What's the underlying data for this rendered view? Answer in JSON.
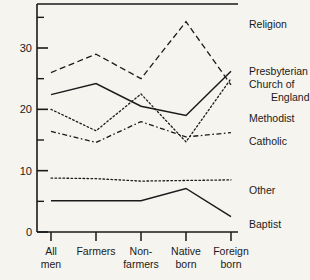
{
  "chart_data": {
    "type": "line",
    "title": "",
    "xlabel": "",
    "ylabel": "",
    "categories": [
      "All men",
      "Farmers",
      "Non-farmers",
      "Native born",
      "Foreign born"
    ],
    "category_lines": [
      [
        "All",
        "men"
      ],
      [
        "Farmers",
        ""
      ],
      [
        "Non-",
        "farmers"
      ],
      [
        "Native",
        "born"
      ],
      [
        "Foreign",
        "born"
      ]
    ],
    "ylim": [
      0,
      36
    ],
    "yticks_major": [
      0,
      10,
      20,
      30
    ],
    "yticks_minor": [
      5,
      15,
      25,
      35
    ],
    "ytick_labels": [
      "0",
      "10",
      "20",
      "30"
    ],
    "grid": false,
    "legend_position": "right",
    "legend_title": "Religion",
    "series": [
      {
        "name": "Presbyterian Church of England",
        "legend_lines": [
          "Presbyterian",
          "Church of",
          "England"
        ],
        "style": "dashed",
        "values": [
          26.0,
          29.0,
          25.0,
          34.3,
          24.0
        ]
      },
      {
        "name": "Methodist",
        "legend_lines": [
          "Methodist"
        ],
        "style": "dotted",
        "values": [
          20.0,
          16.5,
          22.5,
          14.7,
          25.0
        ]
      },
      {
        "name": "Catholic",
        "legend_lines": [
          "Catholic"
        ],
        "style": "dashdot",
        "values": [
          16.4,
          14.6,
          18.0,
          15.5,
          16.2
        ]
      },
      {
        "name": "Other",
        "legend_lines": [
          "Other"
        ],
        "style": "dotted",
        "values": [
          8.8,
          8.7,
          8.3,
          8.4,
          8.5
        ]
      },
      {
        "name": "Baptist",
        "legend_lines": [
          "Baptist"
        ],
        "style": "solid",
        "values": [
          5.1,
          5.1,
          5.1,
          7.1,
          2.5
        ]
      },
      {
        "name": "Unlabeled solid upper",
        "legend_lines": [],
        "style": "solid",
        "values": [
          22.4,
          24.2,
          20.5,
          19.0,
          26.2
        ]
      }
    ],
    "colors": {
      "ink": "#1a1a1a",
      "background": "#f6f4ef"
    }
  }
}
